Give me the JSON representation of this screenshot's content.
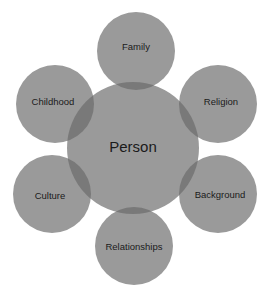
{
  "diagram": {
    "type": "venn-overlap-hub-and-spoke",
    "title": "Person",
    "background_color": "#ffffff",
    "circle_color": "#9a9a9a",
    "overlap_color": "#797979",
    "text_color": "#1a1a1a",
    "center": {
      "label": "Person",
      "cx": 133,
      "cy": 148,
      "r": 66,
      "font_size": 15
    },
    "satellites": [
      {
        "id": "family",
        "label": "Family",
        "cx": 136,
        "cy": 51,
        "r": 39,
        "label_x": 136,
        "label_y": 47,
        "position": "top"
      },
      {
        "id": "religion",
        "label": "Religion",
        "cx": 218,
        "cy": 104,
        "r": 39,
        "label_x": 221,
        "label_y": 102,
        "position": "top-right"
      },
      {
        "id": "background",
        "label": "Background",
        "cx": 218,
        "cy": 194,
        "r": 39,
        "label_x": 220,
        "label_y": 195,
        "position": "bottom-right"
      },
      {
        "id": "relationships",
        "label": "Relationships",
        "cx": 134,
        "cy": 246,
        "r": 39,
        "label_x": 134,
        "label_y": 247,
        "position": "bottom"
      },
      {
        "id": "culture",
        "label": "Culture",
        "cx": 52,
        "cy": 194,
        "r": 39,
        "label_x": 50,
        "label_y": 196,
        "position": "bottom-left"
      },
      {
        "id": "childhood",
        "label": "Childhood",
        "cx": 55,
        "cy": 104,
        "r": 39,
        "label_x": 53,
        "label_y": 102,
        "position": "top-left"
      }
    ]
  }
}
